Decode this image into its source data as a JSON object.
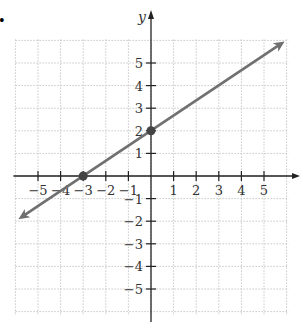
{
  "problem_marker": "•",
  "chart_data": {
    "type": "line",
    "title": "",
    "xlabel": "x",
    "ylabel": "y",
    "xlim": [
      -6,
      6
    ],
    "ylim": [
      -6,
      6
    ],
    "grid": true,
    "x_ticks": [
      -5,
      -4,
      -3,
      -2,
      -1,
      1,
      2,
      3,
      4,
      5
    ],
    "y_ticks": [
      5,
      4,
      3,
      2,
      1,
      -1,
      -2,
      -3,
      -4,
      -5
    ],
    "x_tick_labels": [
      "−5",
      "−4",
      "−3",
      "−2",
      "−1",
      "1",
      "2",
      "3",
      "4",
      "5"
    ],
    "y_tick_labels": [
      "5",
      "4",
      "3",
      "2",
      "1",
      "−1",
      "−2",
      "−3",
      "−4",
      "−5"
    ],
    "series": [
      {
        "name": "line",
        "equation": "y = (2/3)x + 2",
        "x": [
          -6,
          6
        ],
        "y": [
          -2,
          6
        ],
        "arrows_both_ends": true,
        "color": "#707070"
      }
    ],
    "points": [
      {
        "x": -3,
        "y": 0,
        "label": "x-intercept"
      },
      {
        "x": 0,
        "y": 2,
        "label": "y-intercept"
      }
    ]
  },
  "colors": {
    "axis": "#222222",
    "grid": "#c8c8c8",
    "line": "#707070",
    "point": "#444444"
  }
}
